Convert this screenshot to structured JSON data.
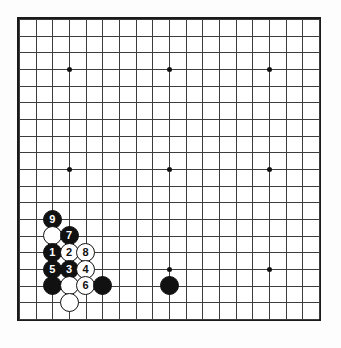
{
  "diagram": {
    "board_size": 19,
    "line_color": "#3d3d3d",
    "border_color": "#1a1a1a",
    "background_color": "#fdfdfd",
    "black_color": "#111111",
    "white_color": "#ffffff"
  },
  "star_points": [
    {
      "col": 4,
      "row": 4
    },
    {
      "col": 10,
      "row": 4
    },
    {
      "col": 16,
      "row": 4
    },
    {
      "col": 4,
      "row": 10
    },
    {
      "col": 10,
      "row": 10
    },
    {
      "col": 16,
      "row": 10
    },
    {
      "col": 4,
      "row": 16
    },
    {
      "col": 10,
      "row": 16
    },
    {
      "col": 16,
      "row": 16
    }
  ],
  "stones": [
    {
      "col": 3,
      "row": 13,
      "color": "black",
      "label": "9"
    },
    {
      "col": 3,
      "row": 14,
      "color": "white",
      "label": ""
    },
    {
      "col": 4,
      "row": 14,
      "color": "black",
      "label": "7"
    },
    {
      "col": 3,
      "row": 15,
      "color": "black",
      "label": "1"
    },
    {
      "col": 4,
      "row": 15,
      "color": "white",
      "label": "2"
    },
    {
      "col": 5,
      "row": 15,
      "color": "white",
      "label": "8"
    },
    {
      "col": 3,
      "row": 16,
      "color": "black",
      "label": "5"
    },
    {
      "col": 4,
      "row": 16,
      "color": "black",
      "label": "3"
    },
    {
      "col": 5,
      "row": 16,
      "color": "white",
      "label": "4"
    },
    {
      "col": 3,
      "row": 17,
      "color": "black",
      "label": ""
    },
    {
      "col": 4,
      "row": 17,
      "color": "white",
      "label": ""
    },
    {
      "col": 5,
      "row": 17,
      "color": "white",
      "label": "6"
    },
    {
      "col": 6,
      "row": 17,
      "color": "black",
      "label": ""
    },
    {
      "col": 4,
      "row": 18,
      "color": "white",
      "label": ""
    },
    {
      "col": 10,
      "row": 17,
      "color": "black",
      "label": ""
    }
  ],
  "geometry": {
    "origin_x": 19,
    "origin_y": 19,
    "spacing": 16.6667
  }
}
